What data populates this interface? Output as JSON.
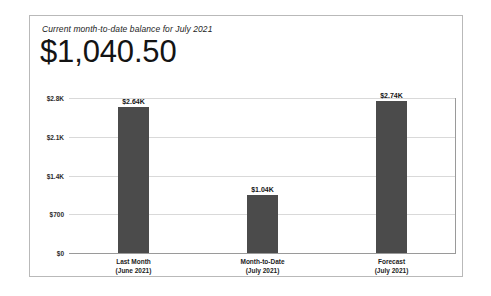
{
  "card": {
    "title": "Current month-to-date balance for July 2021",
    "balance": "$1,040.50"
  },
  "colors": {
    "bar": "#4b4b4b",
    "gridline": "#d9d9d9",
    "axis": "#9a9a9a",
    "card_border": "#b9b9b9",
    "text": "#1d1d1d"
  },
  "chart_data": {
    "type": "bar",
    "title": "Current month-to-date balance for July 2021",
    "xlabel": "",
    "ylabel": "",
    "ylim": [
      0,
      2800
    ],
    "grid": true,
    "legend": false,
    "categories": [
      "Last Month (June 2021)",
      "Month-to-Date (July 2021)",
      "Forecast (July 2021)"
    ],
    "category_lines": [
      [
        "Last Month",
        "(June 2021)"
      ],
      [
        "Month-to-Date",
        "(July 2021)"
      ],
      [
        "Forecast",
        "(July 2021)"
      ]
    ],
    "values": [
      2640,
      1040,
      2740
    ],
    "value_labels": [
      "$2.64K",
      "$1.04K",
      "$2.74K"
    ],
    "yticks": [
      0,
      700,
      1400,
      2100,
      2800
    ],
    "ytick_labels": [
      "$0",
      "$700",
      "$1.4K",
      "$2.1K",
      "$2.8K"
    ]
  },
  "bottom_caption": {
    "clipped_text": ""
  }
}
